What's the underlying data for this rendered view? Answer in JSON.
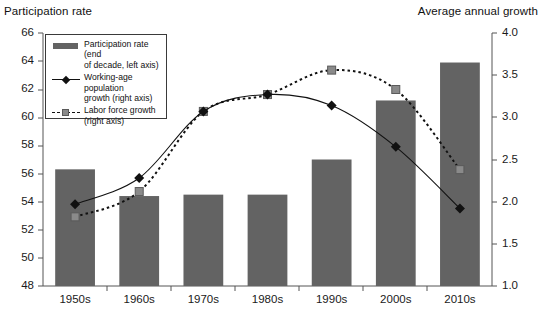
{
  "chart_data": {
    "type": "bar",
    "title": "",
    "left_axis_title": "Participation rate",
    "right_axis_title": "Average annual growth",
    "categories": [
      "1950s",
      "1960s",
      "1970s",
      "1980s",
      "1990s",
      "2000s",
      "2010s"
    ],
    "xlabel": "",
    "ylabel": "Participation rate",
    "ylim": [
      48,
      66
    ],
    "yticks": [
      "48",
      "50",
      "52",
      "54",
      "56",
      "58",
      "60",
      "62",
      "64",
      "66"
    ],
    "y2label": "Average annual growth",
    "y2lim": [
      1.0,
      4.0
    ],
    "y2ticks": [
      "1.0",
      "1.5",
      "2.0",
      "2.5",
      "3.0",
      "3.5",
      "4.0"
    ],
    "grid": false,
    "legend_position": "upper-left-inside",
    "series": [
      {
        "name": "Participation rate (end of decade, left axis)",
        "type": "bar",
        "axis": "left",
        "color": "#636363",
        "values": [
          56.3,
          54.4,
          54.5,
          54.5,
          57.0,
          61.2,
          63.9
        ]
      },
      {
        "name": "Working-age population growth (right axis)",
        "type": "line",
        "axis": "right",
        "marker": "diamond",
        "dash": "solid",
        "color": "#111111",
        "values": [
          1.97,
          2.28,
          3.07,
          3.27,
          3.14,
          2.65,
          1.92
        ]
      },
      {
        "name": "Labor force growth (right axis)",
        "type": "line",
        "axis": "right",
        "marker": "square",
        "dash": "dashed",
        "color": "#111111",
        "marker_color": "#8a8a8a",
        "values": [
          1.82,
          2.12,
          3.07,
          3.27,
          3.56,
          3.33,
          2.38
        ]
      }
    ]
  },
  "legend": {
    "items": [
      {
        "label_line1": "Participation rate (end",
        "label_line2": "of decade, left axis)",
        "key": "bar-swatch"
      },
      {
        "label_line1": "Working-age population",
        "label_line2": "growth (right axis)",
        "key": "solid-line-diamond-swatch"
      },
      {
        "label_line1": "Labor force growth",
        "label_line2": "(right axis)",
        "key": "dashed-line-square-swatch"
      }
    ]
  },
  "colors": {
    "bar_fill": "#636363",
    "line_dark": "#111111",
    "marker_gray": "#8a8a8a",
    "axis": "#555555"
  }
}
